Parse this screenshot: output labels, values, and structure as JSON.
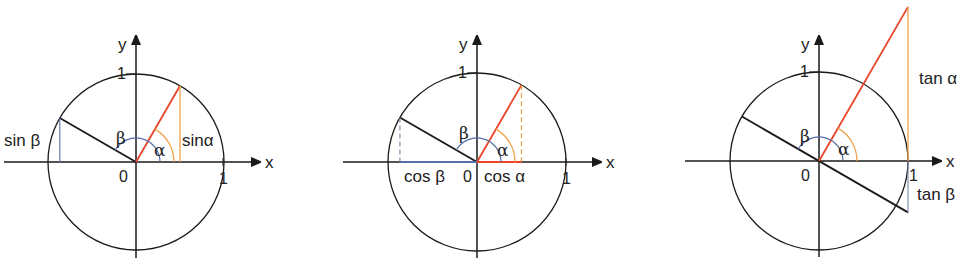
{
  "figure": {
    "colors": {
      "axis": "#1a1a1a",
      "circle": "#1a1a1a",
      "alpha_ray": "#e8452a",
      "alpha_projection": "#f0a04b",
      "alpha_arc": "#f0a04b",
      "beta_ray": "#1a1a1a",
      "beta_projection": "#5a6fa8",
      "beta_arc": "#5a6fa8"
    },
    "angles_deg": {
      "alpha": 60,
      "beta": 150
    },
    "panels": [
      {
        "id": "sine",
        "axis_x_label": "x",
        "axis_y_label": "y",
        "origin_label": "0",
        "unit_x_label": "1",
        "unit_y_label": "1",
        "alpha_label": "α",
        "beta_label": "β",
        "alpha_value_label": "sinα",
        "beta_value_label": "sin β"
      },
      {
        "id": "cosine",
        "axis_x_label": "x",
        "axis_y_label": "y",
        "origin_label": "0",
        "unit_x_label": "1",
        "unit_y_label": "1",
        "alpha_label": "α",
        "beta_label": "β",
        "alpha_value_label": "cos α",
        "beta_value_label": "cos β"
      },
      {
        "id": "tangent",
        "axis_x_label": "x",
        "axis_y_label": "y",
        "origin_label": "0",
        "unit_x_label": "1",
        "unit_y_label": "1",
        "alpha_label": "α",
        "beta_label": "β",
        "alpha_value_label": "tan α",
        "beta_value_label": "tan β"
      }
    ]
  }
}
